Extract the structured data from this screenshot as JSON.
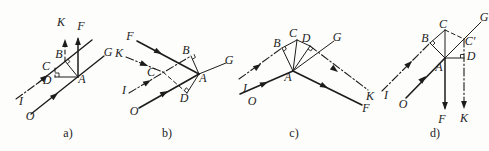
{
  "page": {
    "background": "#fdfdfb",
    "ink": "#1c1c1c",
    "width": 489,
    "height": 151
  },
  "figures": [
    {
      "id": "figure-a",
      "caption": {
        "text": "a)",
        "x": 68,
        "y": 133
      },
      "lines": [
        {
          "x1": 31,
          "y1": 114,
          "x2": 104,
          "y2": 56,
          "style": "solid",
          "w": 1.4
        },
        {
          "x1": 16,
          "y1": 99,
          "x2": 38,
          "y2": 83,
          "style": "dashdot",
          "w": 1.1
        },
        {
          "x1": 38,
          "y1": 83,
          "x2": 92,
          "y2": 40,
          "style": "solid",
          "w": 1.4
        },
        {
          "x1": 78,
          "y1": 77,
          "x2": 78,
          "y2": 39,
          "style": "solid",
          "w": 1.5
        },
        {
          "x1": 65,
          "y1": 61,
          "x2": 65,
          "y2": 41,
          "style": "dashed",
          "w": 1.1
        },
        {
          "x1": 65,
          "y1": 61,
          "x2": 78,
          "y2": 77,
          "style": "solid",
          "w": 1.0
        },
        {
          "x1": 55,
          "y1": 68,
          "x2": 55,
          "y2": 77,
          "style": "dashed",
          "w": 1.0
        },
        {
          "x1": 55,
          "y1": 77,
          "x2": 78,
          "y2": 77,
          "style": "solid",
          "w": 1.0
        }
      ],
      "arrows": [
        {
          "x": 58,
          "y": 93,
          "angle": -38
        },
        {
          "x": 48,
          "y": 75,
          "angle": -38
        },
        {
          "x": 78,
          "y": 37,
          "angle": -90
        },
        {
          "x": 65,
          "y": 39,
          "angle": -90
        }
      ],
      "marks": [
        {
          "pts": [
            [
              67.2,
              63.7
            ],
            [
              69.9,
              61.6
            ],
            [
              67.7,
              58.8
            ]
          ]
        },
        {
          "pts": [
            [
              59,
              77
            ],
            [
              59,
              73
            ],
            [
              55,
              73
            ]
          ]
        }
      ],
      "labels": [
        {
          "text": "K",
          "x": 61,
          "y": 22
        },
        {
          "text": "F",
          "x": 81,
          "y": 26
        },
        {
          "text": "G",
          "x": 108,
          "y": 52
        },
        {
          "text": "B",
          "x": 59,
          "y": 54
        },
        {
          "text": "C",
          "x": 46,
          "y": 66
        },
        {
          "text": "D",
          "x": 47,
          "y": 80
        },
        {
          "text": "A",
          "x": 82,
          "y": 79
        },
        {
          "text": "I",
          "x": 21,
          "y": 101
        },
        {
          "text": "O",
          "x": 30,
          "y": 116
        }
      ]
    },
    {
      "id": "figure-b",
      "caption": {
        "text": "b)",
        "x": 167,
        "y": 133
      },
      "lines": [
        {
          "x1": 139,
          "y1": 108,
          "x2": 199,
          "y2": 74,
          "style": "solid",
          "w": 1.6
        },
        {
          "x1": 137,
          "y1": 41,
          "x2": 199,
          "y2": 74,
          "style": "solid",
          "w": 1.6
        },
        {
          "x1": 199,
          "y1": 74,
          "x2": 226,
          "y2": 63,
          "style": "solid",
          "w": 1.0
        },
        {
          "x1": 129,
          "y1": 93,
          "x2": 191,
          "y2": 56,
          "style": "dashdot",
          "w": 1.1
        },
        {
          "x1": 126,
          "y1": 57,
          "x2": 163,
          "y2": 72,
          "style": "dashdot",
          "w": 1.1
        },
        {
          "x1": 191,
          "y1": 56,
          "x2": 199,
          "y2": 74,
          "style": "solid",
          "w": 1.0
        },
        {
          "x1": 163,
          "y1": 72,
          "x2": 187,
          "y2": 93,
          "style": "dashed",
          "w": 1.0
        },
        {
          "x1": 187,
          "y1": 93,
          "x2": 199,
          "y2": 74,
          "style": "solid",
          "w": 1.0
        }
      ],
      "arrows": [
        {
          "x": 168,
          "y": 91,
          "angle": -29
        },
        {
          "x": 162,
          "y": 54,
          "angle": 28
        },
        {
          "x": 151,
          "y": 80,
          "angle": -31
        },
        {
          "x": 148,
          "y": 66,
          "angle": 22
        }
      ],
      "marks": [
        {
          "pts": [
            [
              192.4,
              59.2
            ],
            [
              195.4,
              57.4
            ],
            [
              194,
              54.2
            ]
          ]
        },
        {
          "pts": [
            [
              188.9,
              90.1
            ],
            [
              186.2,
              87.8
            ],
            [
              184.3,
              90.7
            ]
          ]
        }
      ],
      "labels": [
        {
          "text": "F",
          "x": 130,
          "y": 36
        },
        {
          "text": "K",
          "x": 119,
          "y": 53
        },
        {
          "text": "C",
          "x": 151,
          "y": 72
        },
        {
          "text": "I",
          "x": 124,
          "y": 90
        },
        {
          "text": "O",
          "x": 134,
          "y": 111
        },
        {
          "text": "B",
          "x": 186,
          "y": 50
        },
        {
          "text": "A",
          "x": 203,
          "y": 78
        },
        {
          "text": "D",
          "x": 184,
          "y": 98
        },
        {
          "text": "G",
          "x": 229,
          "y": 60
        }
      ]
    },
    {
      "id": "figure-c",
      "caption": {
        "text": "c)",
        "x": 294,
        "y": 133
      },
      "lines": [
        {
          "x1": 240,
          "y1": 94,
          "x2": 293,
          "y2": 71,
          "style": "solid",
          "w": 1.6
        },
        {
          "x1": 293,
          "y1": 71,
          "x2": 362,
          "y2": 105,
          "style": "solid",
          "w": 1.6
        },
        {
          "x1": 239,
          "y1": 79,
          "x2": 282,
          "y2": 48,
          "style": "dashdot",
          "w": 1.1
        },
        {
          "x1": 282,
          "y1": 48,
          "x2": 297,
          "y2": 40,
          "style": "solid",
          "w": 1.0
        },
        {
          "x1": 297,
          "y1": 40,
          "x2": 310,
          "y2": 46,
          "style": "solid",
          "w": 1.0
        },
        {
          "x1": 310,
          "y1": 46,
          "x2": 368,
          "y2": 90,
          "style": "dashdot",
          "w": 1.1
        },
        {
          "x1": 293,
          "y1": 71,
          "x2": 334,
          "y2": 41,
          "style": "solid",
          "w": 1.0
        },
        {
          "x1": 293,
          "y1": 71,
          "x2": 282,
          "y2": 48,
          "style": "solid",
          "w": 1.0
        },
        {
          "x1": 293,
          "y1": 71,
          "x2": 297,
          "y2": 40,
          "style": "solid",
          "w": 1.0
        },
        {
          "x1": 293,
          "y1": 71,
          "x2": 310,
          "y2": 46,
          "style": "solid",
          "w": 1.0
        }
      ],
      "arrows": [
        {
          "x": 268,
          "y": 82,
          "angle": -23
        },
        {
          "x": 328,
          "y": 88,
          "angle": 26
        },
        {
          "x": 261,
          "y": 64,
          "angle": -36
        },
        {
          "x": 338,
          "y": 72,
          "angle": 37
        }
      ],
      "marks": [
        {
          "pts": [
            [
              283.5,
              51.2
            ],
            [
              286.3,
              49.1
            ],
            [
              284.8,
              46.0
            ]
          ]
        },
        {
          "pts": [
            [
              308,
              48.9
            ],
            [
              310.8,
              51.0
            ],
            [
              312.8,
              48.1
            ]
          ]
        }
      ],
      "labels": [
        {
          "text": "B",
          "x": 277,
          "y": 43
        },
        {
          "text": "C",
          "x": 293,
          "y": 33
        },
        {
          "text": "D",
          "x": 306,
          "y": 38
        },
        {
          "text": "G",
          "x": 337,
          "y": 37
        },
        {
          "text": "A",
          "x": 288,
          "y": 77
        },
        {
          "text": "I",
          "x": 245,
          "y": 88
        },
        {
          "text": "O",
          "x": 252,
          "y": 101
        },
        {
          "text": "F",
          "x": 366,
          "y": 108
        },
        {
          "text": "K",
          "x": 370,
          "y": 96
        }
      ]
    },
    {
      "id": "figure-d",
      "caption": {
        "text": "d)",
        "x": 435,
        "y": 133
      },
      "lines": [
        {
          "x1": 406,
          "y1": 98,
          "x2": 445,
          "y2": 58,
          "style": "solid",
          "w": 1.6
        },
        {
          "x1": 445,
          "y1": 58,
          "x2": 481,
          "y2": 22,
          "style": "solid",
          "w": 1.0
        },
        {
          "x1": 382,
          "y1": 91,
          "x2": 430,
          "y2": 43,
          "style": "dashdot",
          "w": 1.1
        },
        {
          "x1": 430,
          "y1": 43,
          "x2": 445,
          "y2": 30,
          "style": "solid",
          "w": 1.0
        },
        {
          "x1": 445,
          "y1": 58,
          "x2": 445,
          "y2": 30,
          "style": "solid",
          "w": 1.0
        },
        {
          "x1": 445,
          "y1": 30,
          "x2": 464,
          "y2": 39,
          "style": "dashed",
          "w": 1.0
        },
        {
          "x1": 445,
          "y1": 58,
          "x2": 464,
          "y2": 58,
          "style": "solid",
          "w": 1.0
        },
        {
          "x1": 464,
          "y1": 39,
          "x2": 464,
          "y2": 107,
          "style": "dashdot",
          "w": 1.1
        },
        {
          "x1": 445,
          "y1": 58,
          "x2": 445,
          "y2": 108,
          "style": "solid",
          "w": 1.5
        },
        {
          "x1": 430,
          "y1": 43,
          "x2": 445,
          "y2": 58,
          "style": "solid",
          "w": 1.0
        }
      ],
      "arrows": [
        {
          "x": 426,
          "y": 76,
          "angle": -45
        },
        {
          "x": 412,
          "y": 61,
          "angle": -45
        },
        {
          "x": 445,
          "y": 110,
          "angle": 90
        },
        {
          "x": 464,
          "y": 109,
          "angle": 90
        }
      ],
      "marks": [
        {
          "pts": [
            [
              432.5,
              45.5
            ],
            [
              435,
              43
            ],
            [
              432.5,
              40.5
            ]
          ]
        },
        {
          "pts": [
            [
              460.5,
              58
            ],
            [
              460.5,
              54.5
            ],
            [
              464,
              54.5
            ]
          ]
        }
      ],
      "labels": [
        {
          "text": "G",
          "x": 484,
          "y": 17
        },
        {
          "text": "C",
          "x": 443,
          "y": 24
        },
        {
          "text": "B",
          "x": 425,
          "y": 38
        },
        {
          "text": "C′",
          "x": 470,
          "y": 41
        },
        {
          "text": "D",
          "x": 471,
          "y": 56
        },
        {
          "text": "A",
          "x": 439,
          "y": 67
        },
        {
          "text": "I",
          "x": 386,
          "y": 95
        },
        {
          "text": "O",
          "x": 403,
          "y": 104
        },
        {
          "text": "F",
          "x": 442,
          "y": 119
        },
        {
          "text": "K",
          "x": 464,
          "y": 118
        }
      ]
    }
  ]
}
